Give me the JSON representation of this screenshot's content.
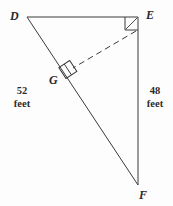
{
  "figure": {
    "kind": "right-triangle-with-altitude",
    "background_color": "#fdfdfd",
    "stroke_color": "#3a3a3a",
    "vertices": [
      {
        "id": "D",
        "label": "D",
        "x": 27,
        "y": 17
      },
      {
        "id": "E",
        "label": "E",
        "x": 138,
        "y": 17
      },
      {
        "id": "F",
        "label": "F",
        "x": 138,
        "y": 185
      },
      {
        "id": "G",
        "label": "G",
        "x": 67,
        "y": 70
      }
    ],
    "segments": [
      {
        "id": "DE",
        "from": "D",
        "to": "E",
        "style": "solid"
      },
      {
        "id": "EF",
        "from": "E",
        "to": "F",
        "style": "solid"
      },
      {
        "id": "DF",
        "from": "D",
        "to": "F",
        "style": "solid"
      },
      {
        "id": "EG",
        "from": "E",
        "to": "G",
        "style": "dashed"
      }
    ],
    "right_angles": [
      {
        "id": "angle-E",
        "at": "E",
        "label": "right-angle-at-E"
      },
      {
        "id": "angle-G",
        "at": "G",
        "label": "right-angle-at-G"
      }
    ],
    "measures": [
      {
        "id": "side-DF",
        "value": "52",
        "unit": "feet",
        "side": "left"
      },
      {
        "id": "side-EF",
        "value": "48",
        "unit": "feet",
        "side": "right"
      }
    ]
  }
}
